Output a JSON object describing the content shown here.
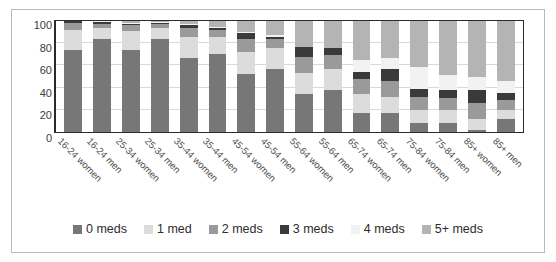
{
  "chart_data": {
    "type": "bar",
    "subtype": "stacked-100-percent",
    "title": "",
    "xlabel": "",
    "ylabel": "",
    "ylim": [
      0,
      100
    ],
    "yticks": [
      0,
      20,
      40,
      60,
      80,
      100
    ],
    "grid": true,
    "legend_position": "bottom",
    "categories": [
      "16-24 women",
      "16-24 men",
      "25-34 women",
      "25-34 men",
      "35-44 women",
      "35-44 men",
      "45-54 women",
      "45-54 men",
      "55-64 women",
      "55-64 men",
      "65-74 women",
      "65-74 men",
      "75-84 women",
      "75-84 men",
      "85+ women",
      "85+ men"
    ],
    "series": [
      {
        "name": "0 meds",
        "color": "#777777",
        "values": [
          74,
          84,
          74,
          84,
          67,
          70,
          52,
          57,
          34,
          38,
          17,
          17,
          8,
          8,
          2,
          12
        ]
      },
      {
        "name": "1 med",
        "color": "#dcdcdc",
        "values": [
          18,
          10,
          17,
          10,
          19,
          16,
          20,
          19,
          19,
          19,
          17,
          15,
          12,
          12,
          10,
          8
        ]
      },
      {
        "name": "2 meds",
        "color": "#9a9a9a",
        "values": [
          6,
          3,
          5,
          3,
          8,
          6,
          12,
          8,
          15,
          12,
          14,
          14,
          12,
          11,
          14,
          9
        ]
      },
      {
        "name": "3 meds",
        "color": "#3a3a3a",
        "values": [
          2,
          2,
          1,
          1,
          2,
          2,
          5,
          2,
          9,
          7,
          6,
          11,
          7,
          7,
          12,
          6
        ]
      },
      {
        "name": "4 meds",
        "color": "#f2f2f2",
        "values": [
          0,
          1,
          1,
          1,
          1,
          1,
          1,
          1,
          0,
          0,
          11,
          10,
          20,
          13,
          12,
          11
        ]
      },
      {
        "name": "5+ meds",
        "color": "#b4b4b4",
        "values": [
          0,
          0,
          2,
          1,
          3,
          5,
          10,
          13,
          23,
          24,
          35,
          33,
          41,
          49,
          50,
          54
        ]
      }
    ]
  },
  "legend": {
    "items": [
      {
        "label": "0 meds",
        "color": "#777777"
      },
      {
        "label": "1 med",
        "color": "#dcdcdc"
      },
      {
        "label": "2 meds",
        "color": "#9a9a9a"
      },
      {
        "label": "3 meds",
        "color": "#3a3a3a"
      },
      {
        "label": "4 meds",
        "color": "#f2f2f2"
      },
      {
        "label": "5+ meds",
        "color": "#b4b4b4"
      }
    ]
  },
  "axis": {
    "y_ticks": [
      "100",
      "80",
      "60",
      "40",
      "20",
      "0"
    ]
  },
  "colors": {
    "frame": "#b9b9b9",
    "plot_border": "#2a2a2a",
    "gridline": "#d9d9d9",
    "tick_text": "#3b3b3b",
    "label_text": "#4a4a4a"
  }
}
